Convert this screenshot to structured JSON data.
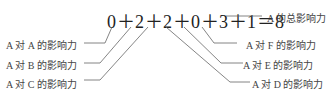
{
  "equation": "0＋2＋2＋0＋3＋1＝8",
  "labels": {
    "total": "A 的总影响力",
    "a_on_a": "A 对 A 的影响力",
    "a_on_b": "A 对 B 的影响力",
    "a_on_c": "A 对 C 的影响力",
    "a_on_d": "A 对 D 的影响力",
    "a_on_e": "A 对 E 的影响力",
    "a_on_f": "A 对 F 的影响力"
  },
  "terms": [
    {
      "value": 0,
      "label": "A 对 A 的影响力"
    },
    {
      "value": 2,
      "label": "A 对 B 的影响力"
    },
    {
      "value": 2,
      "label": "A 对 C 的影响力"
    },
    {
      "value": 0,
      "label": "A 对 D 的影响力"
    },
    {
      "value": 3,
      "label": "A 对 E 的影响力"
    },
    {
      "value": 1,
      "label": "A 对 F 的影响力"
    }
  ],
  "total": 8
}
